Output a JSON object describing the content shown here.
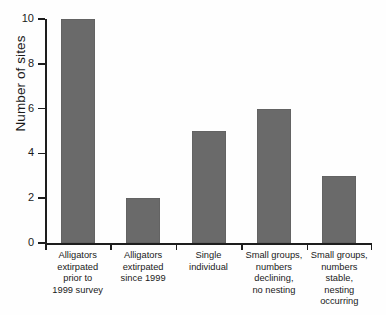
{
  "chart_data": {
    "type": "bar",
    "title": "",
    "xlabel": "",
    "ylabel": "Number of sites",
    "ylim": [
      0,
      10
    ],
    "ytick_labels": [
      "0",
      "2",
      "4",
      "6",
      "8",
      "10"
    ],
    "ytick_values": [
      0,
      2,
      4,
      6,
      8,
      10
    ],
    "grid": false,
    "legend": false,
    "categories": [
      "Alligators extirpated prior to 1999 survey",
      "Alligators extirpated since 1999",
      "Single individual",
      "Small groups, numbers declining, no nesting",
      "Small groups, numbers stable, nesting occurring"
    ],
    "category_lines": [
      [
        "Alligators",
        "extirpated",
        "prior to",
        "1999 survey"
      ],
      [
        "Alligators",
        "extirpated",
        "since 1999"
      ],
      [
        "Single",
        "individual"
      ],
      [
        "Small groups,",
        "numbers",
        "declining,",
        "no nesting"
      ],
      [
        "Small groups,",
        "numbers stable,",
        "nesting",
        "occurring"
      ]
    ],
    "values": [
      10,
      2,
      5,
      6,
      3
    ],
    "bar_color": "#6a6a6a",
    "axis_color": "#1d1d1d",
    "background_color": "#fefefe"
  }
}
